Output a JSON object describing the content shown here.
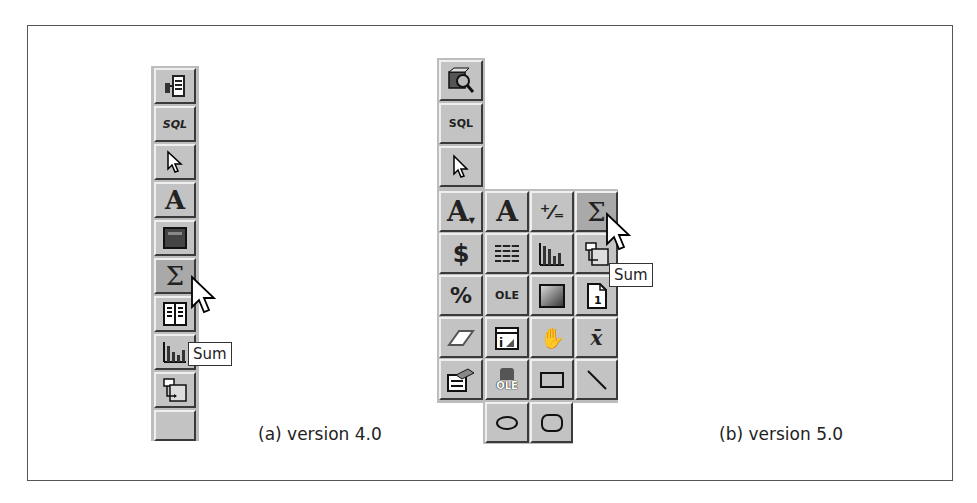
{
  "figure": {
    "caption_a": "(a) version 4.0",
    "caption_b": "(b) version 5.0"
  },
  "toolbox_v4": {
    "tooltip": "Sum",
    "buttons": [
      {
        "icon": "field-list-icon"
      },
      {
        "icon": "sql-icon",
        "label": "SQL"
      },
      {
        "icon": "pointer-icon"
      },
      {
        "icon": "text-icon",
        "label": "A"
      },
      {
        "icon": "text-box-icon"
      },
      {
        "icon": "sum-icon",
        "label": "Σ"
      },
      {
        "icon": "columns-icon"
      },
      {
        "icon": "bar-chart-icon"
      },
      {
        "icon": "subreport-icon"
      },
      {
        "icon": "more-icon"
      }
    ]
  },
  "toolbox_v5": {
    "tooltip": "Sum",
    "buttons": [
      {
        "icon": "magnifier-icon"
      },
      {
        "icon": "sql-icon",
        "label": "SQL"
      },
      {
        "icon": "pointer-icon"
      },
      {
        "icon": "text-dropdown-icon",
        "label": "A"
      },
      {
        "icon": "text-icon",
        "label": "A"
      },
      {
        "icon": "plus-minus-icon",
        "label": "+/="
      },
      {
        "icon": "sum-icon",
        "label": "Σ"
      },
      {
        "icon": "currency-icon",
        "label": "$"
      },
      {
        "icon": "lines-icon"
      },
      {
        "icon": "bar-chart-icon"
      },
      {
        "icon": "subreport-icon"
      },
      {
        "icon": "percent-icon",
        "label": "%"
      },
      {
        "icon": "ole-icon",
        "label": "OLE"
      },
      {
        "icon": "picture-icon"
      },
      {
        "icon": "page-number-icon",
        "label": "1"
      },
      {
        "icon": "eraser-icon"
      },
      {
        "icon": "calendar-icon"
      },
      {
        "icon": "hand-icon"
      },
      {
        "icon": "average-icon",
        "label": "x̄"
      },
      {
        "icon": "form-icon"
      },
      {
        "icon": "ole-database-icon",
        "label": "OLE"
      },
      {
        "icon": "rectangle-icon"
      },
      {
        "icon": "line-icon"
      },
      {
        "icon": "ellipse-icon"
      },
      {
        "icon": "rounded-rectangle-icon"
      }
    ]
  }
}
